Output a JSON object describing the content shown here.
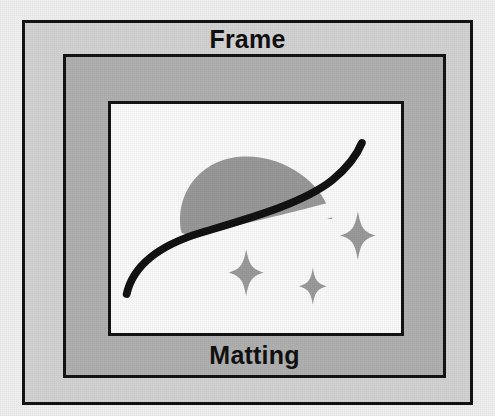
{
  "diagram": {
    "background_color": "#f1f1f1",
    "frame": {
      "label": "Frame",
      "fill_color": "#d4d4d4",
      "border_color": "#141414"
    },
    "matting": {
      "label": "Matting",
      "fill_color": "#b1b1b1",
      "border_color": "#141414"
    },
    "artwork": {
      "label": "Artwork",
      "fill_color": "#fbfbfb",
      "border_color": "#141414",
      "elements": [
        {
          "name": "hill-blob",
          "shape": "dome",
          "color": "#999999"
        },
        {
          "name": "swoosh-curve",
          "shape": "s-curve-stroke",
          "color": "#111111"
        },
        {
          "name": "sparkle-large",
          "shape": "four-point-star",
          "color": "#9b9b9b"
        },
        {
          "name": "sparkle-medium",
          "shape": "four-point-star",
          "color": "#9b9b9b"
        },
        {
          "name": "sparkle-small",
          "shape": "four-point-star",
          "color": "#9b9b9b"
        }
      ]
    }
  }
}
